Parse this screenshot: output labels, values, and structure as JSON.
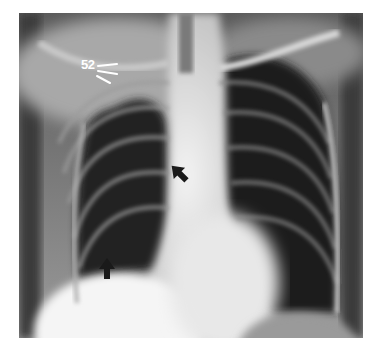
{
  "figure": {
    "type": "chest-radiograph",
    "view": "PA",
    "annotations": {
      "rib_label": "52",
      "arrows": [
        {
          "name": "mediastinal-arrow",
          "direction": "up-left",
          "x": 178,
          "y": 172
        },
        {
          "name": "diaphragm-arrow",
          "direction": "up",
          "x": 107,
          "y": 267
        }
      ]
    },
    "colors": {
      "background": "#ffffff",
      "lung_dark": "#1e1e1e",
      "bone_bright": "#f4f4f4",
      "arrow": "#1a1a1a",
      "label": "#ffffff"
    }
  }
}
